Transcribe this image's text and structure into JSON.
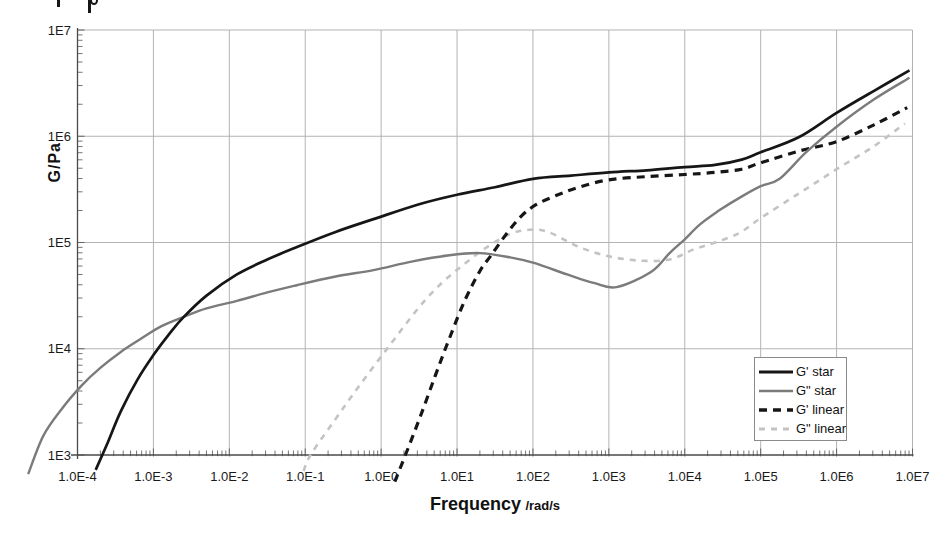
{
  "figure": {
    "y_axis_title": "G/Pa",
    "x_axis_title_main": "Frequency",
    "x_axis_title_unit": "/rad/s"
  },
  "chart_data": {
    "type": "line",
    "scale": "log-log",
    "title": "",
    "xlabel": "Frequency /rad/s",
    "ylabel": "G/Pa",
    "xlim_log10": [
      -4,
      7
    ],
    "ylim_log10": [
      3,
      7
    ],
    "x_ticks_log10": [
      -4,
      -3,
      -2,
      -1,
      0,
      1,
      2,
      3,
      4,
      5,
      6,
      7
    ],
    "x_tick_labels": [
      "1.0E-4",
      "1.0E-3",
      "1.0E-2",
      "1.0E-1",
      "1.0E0",
      "1.0E1",
      "1.0E2",
      "1.0E3",
      "1.0E4",
      "1.0E5",
      "1.0E6",
      "1.0E7"
    ],
    "y_ticks_log10": [
      3,
      4,
      5,
      6,
      7
    ],
    "y_tick_labels": [
      "1E3",
      "1E4",
      "1E5",
      "1E6",
      "1E7"
    ],
    "grid": true,
    "grid_color": "#b3b3b3",
    "axis_color": "#4a4a4a",
    "legend_position": "lower-right",
    "series": [
      {
        "name": "G' star",
        "style": "solid",
        "color": "#161616",
        "width": 2.7,
        "dash": "",
        "points_log10": [
          [
            -3.76,
            2.86
          ],
          [
            -3.6,
            3.12
          ],
          [
            -3.43,
            3.41
          ],
          [
            -3.21,
            3.71
          ],
          [
            -3.0,
            3.94
          ],
          [
            -2.78,
            4.15
          ],
          [
            -2.6,
            4.3
          ],
          [
            -2.3,
            4.5
          ],
          [
            -1.9,
            4.7
          ],
          [
            -1.5,
            4.84
          ],
          [
            -1.1,
            4.96
          ],
          [
            -0.6,
            5.1
          ],
          [
            -0.1,
            5.22
          ],
          [
            0.5,
            5.36
          ],
          [
            1.0,
            5.45
          ],
          [
            1.5,
            5.52
          ],
          [
            2.0,
            5.6
          ],
          [
            2.5,
            5.63
          ],
          [
            3.0,
            5.66
          ],
          [
            3.5,
            5.68
          ],
          [
            4.0,
            5.71
          ],
          [
            4.4,
            5.73
          ],
          [
            4.75,
            5.78
          ],
          [
            5.0,
            5.85
          ],
          [
            5.5,
            5.99
          ],
          [
            6.0,
            6.22
          ],
          [
            6.5,
            6.43
          ],
          [
            6.96,
            6.62
          ]
        ]
      },
      {
        "name": "G\" star",
        "style": "solid",
        "color": "#7b7b7b",
        "width": 2.4,
        "dash": "",
        "points_log10": [
          [
            -4.65,
            2.82
          ],
          [
            -4.45,
            3.18
          ],
          [
            -4.2,
            3.44
          ],
          [
            -3.95,
            3.65
          ],
          [
            -3.7,
            3.82
          ],
          [
            -3.43,
            3.97
          ],
          [
            -3.15,
            4.1
          ],
          [
            -2.9,
            4.21
          ],
          [
            -2.6,
            4.3
          ],
          [
            -2.3,
            4.38
          ],
          [
            -1.9,
            4.45
          ],
          [
            -1.5,
            4.53
          ],
          [
            -1.1,
            4.6
          ],
          [
            -0.6,
            4.68
          ],
          [
            -0.1,
            4.74
          ],
          [
            0.4,
            4.82
          ],
          [
            0.9,
            4.88
          ],
          [
            1.3,
            4.9
          ],
          [
            1.7,
            4.86
          ],
          [
            2.0,
            4.81
          ],
          [
            2.45,
            4.7
          ],
          [
            2.8,
            4.62
          ],
          [
            3.1,
            4.58
          ],
          [
            3.55,
            4.72
          ],
          [
            3.8,
            4.9
          ],
          [
            4.0,
            5.03
          ],
          [
            4.2,
            5.17
          ],
          [
            4.45,
            5.3
          ],
          [
            4.72,
            5.42
          ],
          [
            5.0,
            5.53
          ],
          [
            5.25,
            5.6
          ],
          [
            5.6,
            5.85
          ],
          [
            6.0,
            6.09
          ],
          [
            6.5,
            6.35
          ],
          [
            6.96,
            6.55
          ]
        ]
      },
      {
        "name": "G' linear",
        "style": "dashed",
        "color": "#161616",
        "width": 3.2,
        "dash": "8 6",
        "points_log10": [
          [
            0.18,
            2.75
          ],
          [
            0.32,
            3.0
          ],
          [
            0.51,
            3.35
          ],
          [
            0.71,
            3.74
          ],
          [
            0.9,
            4.1
          ],
          [
            1.1,
            4.45
          ],
          [
            1.3,
            4.73
          ],
          [
            1.45,
            4.88
          ],
          [
            1.65,
            5.08
          ],
          [
            1.85,
            5.25
          ],
          [
            2.05,
            5.36
          ],
          [
            2.3,
            5.44
          ],
          [
            2.6,
            5.52
          ],
          [
            3.0,
            5.59
          ],
          [
            3.5,
            5.62
          ],
          [
            4.0,
            5.64
          ],
          [
            4.4,
            5.66
          ],
          [
            4.75,
            5.69
          ],
          [
            5.0,
            5.75
          ],
          [
            5.5,
            5.86
          ],
          [
            6.0,
            5.95
          ],
          [
            6.5,
            6.11
          ],
          [
            6.93,
            6.27
          ]
        ]
      },
      {
        "name": "G\" linear",
        "style": "dashed",
        "color": "#c3c3c3",
        "width": 2.6,
        "dash": "6 6",
        "points_log10": [
          [
            -1.02,
            2.85
          ],
          [
            -0.93,
            3.0
          ],
          [
            -0.6,
            3.34
          ],
          [
            -0.3,
            3.64
          ],
          [
            0.1,
            4.02
          ],
          [
            0.5,
            4.39
          ],
          [
            0.8,
            4.62
          ],
          [
            1.1,
            4.8
          ],
          [
            1.4,
            4.96
          ],
          [
            1.7,
            5.08
          ],
          [
            1.95,
            5.12
          ],
          [
            2.2,
            5.1
          ],
          [
            2.6,
            4.96
          ],
          [
            3.0,
            4.87
          ],
          [
            3.4,
            4.83
          ],
          [
            3.8,
            4.84
          ],
          [
            4.1,
            4.93
          ],
          [
            4.4,
            5.0
          ],
          [
            4.72,
            5.09
          ],
          [
            5.0,
            5.23
          ],
          [
            5.5,
            5.46
          ],
          [
            6.0,
            5.69
          ],
          [
            6.5,
            5.91
          ],
          [
            6.9,
            6.12
          ]
        ]
      }
    ]
  }
}
